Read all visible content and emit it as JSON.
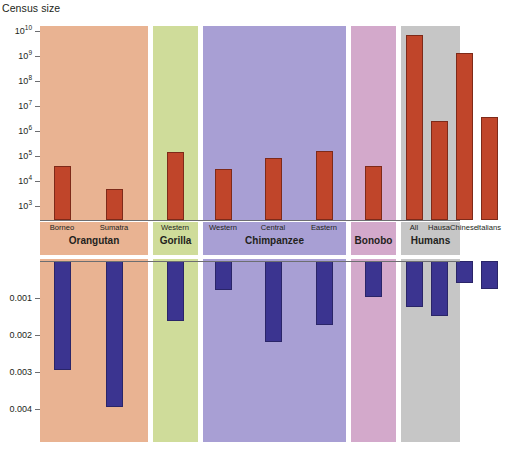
{
  "figure": {
    "top_axis_title": "Census size",
    "background": "#ffffff"
  },
  "groups": [
    {
      "name": "Orangutan",
      "color": "#e9b392",
      "label_color": "#e9b392"
    },
    {
      "name": "Gorilla",
      "color": "#cfdc9a",
      "label_color": "#cfdc9a"
    },
    {
      "name": "Chimpanzee",
      "color": "#a89fd4",
      "label_color": "#a89fd4"
    },
    {
      "name": "Bonobo",
      "color": "#d3a9cb",
      "label_color": "#d3a9cb"
    },
    {
      "name": "Humans",
      "color": "#c6c6c6",
      "label_color": "#c6c6c6"
    }
  ],
  "chart_data": [
    {
      "id": "census-size",
      "type": "bar",
      "title": "Census size",
      "ylabel": "Census size",
      "xlabel": "",
      "scale": "log10",
      "ylim": [
        1000,
        10000000000
      ],
      "grid": false,
      "legend": "none",
      "bar_color": "#c0452a",
      "tick_labels": [
        "10^10",
        "10^9",
        "10^8",
        "10^7",
        "10^6",
        "10^5",
        "10^4",
        "10^3"
      ],
      "tick_values": [
        10000000000.0,
        1000000000.0,
        100000000.0,
        10000000.0,
        1000000.0,
        100000.0,
        10000.0,
        1000.0
      ],
      "categories": [
        "Borneo",
        "Sumatra",
        "Western",
        "Western",
        "Central",
        "Eastern",
        "",
        "All",
        "Hausa",
        "Chinese",
        "Italians"
      ],
      "points": [
        {
          "group": "Orangutan",
          "label": "Borneo",
          "value": 40000
        },
        {
          "group": "Orangutan",
          "label": "Sumatra",
          "value": 5000
        },
        {
          "group": "Gorilla",
          "label": "Western",
          "value": 150000
        },
        {
          "group": "Chimpanzee",
          "label": "Western",
          "value": 30000
        },
        {
          "group": "Chimpanzee",
          "label": "Central",
          "value": 80000
        },
        {
          "group": "Chimpanzee",
          "label": "Eastern",
          "value": 160000
        },
        {
          "group": "Bonobo",
          "label": "",
          "value": 40000
        },
        {
          "group": "Humans",
          "label": "All",
          "value": 7000000000
        },
        {
          "group": "Humans",
          "label": "Hausa",
          "value": 2500000
        },
        {
          "group": "Humans",
          "label": "Chinese",
          "value": 1300000000
        },
        {
          "group": "Humans",
          "label": "Italians",
          "value": 3500000
        }
      ]
    },
    {
      "id": "nucleotide-diversity",
      "type": "bar",
      "title": "",
      "ylabel": "",
      "xlabel": "",
      "scale": "linear",
      "direction": "inverted",
      "ylim": [
        0,
        0.00452
      ],
      "grid": false,
      "legend": "none",
      "bar_color": "#3b3490",
      "tick_labels": [
        "0.001",
        "0.002",
        "0.003",
        "0.004"
      ],
      "tick_values": [
        0.001,
        0.002,
        0.003,
        0.004
      ],
      "categories": [
        "Borneo",
        "Sumatra",
        "Western",
        "Western",
        "Central",
        "Eastern",
        "",
        "All",
        "Hausa",
        "Chinese",
        "Italians"
      ],
      "points": [
        {
          "group": "Orangutan",
          "label": "Borneo",
          "value": 0.00295
        },
        {
          "group": "Orangutan",
          "label": "Sumatra",
          "value": 0.00395
        },
        {
          "group": "Gorilla",
          "label": "Western",
          "value": 0.00162
        },
        {
          "group": "Chimpanzee",
          "label": "Western",
          "value": 0.00079
        },
        {
          "group": "Chimpanzee",
          "label": "Central",
          "value": 0.0022
        },
        {
          "group": "Chimpanzee",
          "label": "Eastern",
          "value": 0.00173
        },
        {
          "group": "Bonobo",
          "label": "",
          "value": 0.00098
        },
        {
          "group": "Humans",
          "label": "All",
          "value": 0.00125
        },
        {
          "group": "Humans",
          "label": "Hausa",
          "value": 0.00148
        },
        {
          "group": "Humans",
          "label": "Chinese",
          "value": 0.00059
        },
        {
          "group": "Humans",
          "label": "Italians",
          "value": 0.00076
        }
      ]
    }
  ],
  "labels": {
    "sub": [
      "Borneo",
      "Sumatra",
      "Western",
      "Western",
      "Central",
      "Eastern",
      "",
      "All",
      "Hausa",
      "Chinese",
      "Italians"
    ],
    "main": [
      "Orangutan",
      "Gorilla",
      "Chimpanzee",
      "Bonobo",
      "Humans"
    ]
  }
}
